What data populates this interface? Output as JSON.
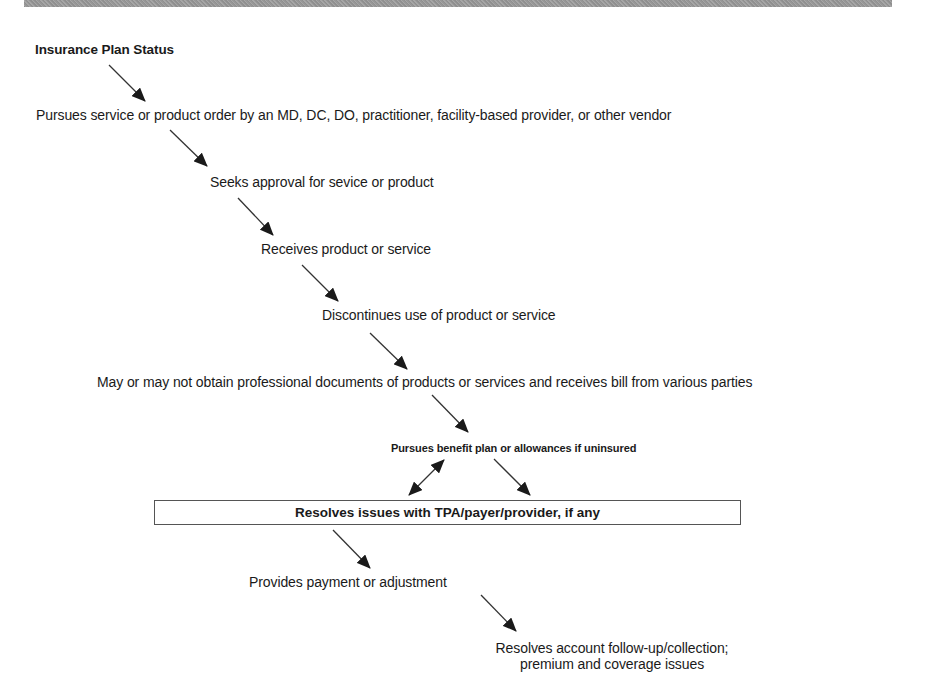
{
  "diagram": {
    "title": "Insurance Plan Status",
    "steps": [
      {
        "id": "pursues-order",
        "text": "Pursues service or product order by an MD, DC, DO, practitioner, facility-based provider, or other vendor"
      },
      {
        "id": "seeks-approval",
        "text": "Seeks approval for sevice or product"
      },
      {
        "id": "receives",
        "text": "Receives product or service"
      },
      {
        "id": "discontinues",
        "text": "Discontinues use of product or service"
      },
      {
        "id": "documents-bill",
        "text": "May or may not obtain professional documents of products or services and receives bill from various parties"
      },
      {
        "id": "benefit-plan",
        "text": "Pursues benefit plan or allowances if uninsured"
      },
      {
        "id": "resolves-issues",
        "text": "Resolves issues with TPA/payer/provider, if any"
      },
      {
        "id": "payment",
        "text": "Provides payment or adjustment"
      },
      {
        "id": "account-followup",
        "text_line1": "Resolves account follow-up/collection;",
        "text_line2": "premium and coverage issues"
      }
    ],
    "connections": [
      {
        "from": "title",
        "to": "pursues-order",
        "type": "arrow"
      },
      {
        "from": "pursues-order",
        "to": "seeks-approval",
        "type": "arrow"
      },
      {
        "from": "seeks-approval",
        "to": "receives",
        "type": "arrow"
      },
      {
        "from": "receives",
        "to": "discontinues",
        "type": "arrow"
      },
      {
        "from": "discontinues",
        "to": "documents-bill",
        "type": "arrow"
      },
      {
        "from": "documents-bill",
        "to": "benefit-plan",
        "type": "arrow"
      },
      {
        "from": "benefit-plan",
        "to": "resolves-issues",
        "type": "double-arrow"
      },
      {
        "from": "benefit-plan",
        "to": "resolves-issues",
        "type": "arrow"
      },
      {
        "from": "resolves-issues",
        "to": "payment",
        "type": "arrow"
      },
      {
        "from": "payment",
        "to": "account-followup",
        "type": "arrow"
      }
    ]
  }
}
